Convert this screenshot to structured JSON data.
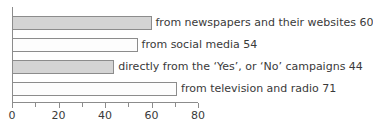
{
  "chart_data": {
    "type": "bar",
    "orientation": "horizontal",
    "title": "",
    "xlabel": "",
    "ylabel": "",
    "xlim": [
      0,
      80
    ],
    "grid": false,
    "legend": "none",
    "categories": [
      "from newspapers and their websites",
      "from social media",
      "directly from the ‘Yes’, or ‘No’ campaigns",
      "from television and radio"
    ],
    "values": [
      60,
      54,
      44,
      71
    ],
    "bar_labels": [
      "from newspapers and their websites 60",
      "from social media 54",
      "directly from the ‘Yes’, or ‘No’ campaigns 44",
      "from television and radio 71"
    ],
    "bar_fills": [
      "#d4d4d4",
      "#fdfdfd",
      "#d4d4d4",
      "#fdfdfd"
    ],
    "xticks": [
      0,
      20,
      40,
      60,
      80
    ],
    "xtick_labels": [
      "0",
      "20",
      "40",
      "60",
      "80"
    ],
    "minor_xticks": [
      10,
      30,
      50,
      70
    ],
    "axis_color": "#8c8c8c",
    "text_color": "#3a3a3a"
  }
}
